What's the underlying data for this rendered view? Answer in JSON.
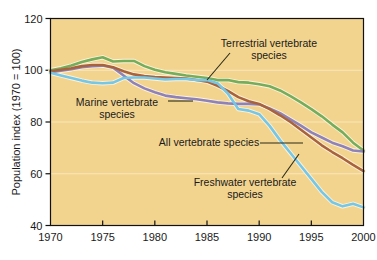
{
  "chart_data": {
    "type": "line",
    "title": "",
    "subtitle": "",
    "xlabel": "",
    "ylabel": "Population index (1970 = 100)",
    "xlim": [
      1970,
      2000
    ],
    "ylim": [
      40,
      120
    ],
    "xticks": [
      1970,
      1975,
      1980,
      1985,
      1990,
      1995,
      2000
    ],
    "yticks": [
      40,
      60,
      80,
      100,
      120
    ],
    "grid": "horizontal-light",
    "legend_position": "inline-annotations",
    "background_color": "#f2d48f",
    "x": [
      1970,
      1971,
      1972,
      1973,
      1974,
      1975,
      1976,
      1977,
      1978,
      1979,
      1980,
      1981,
      1982,
      1983,
      1984,
      1985,
      1986,
      1987,
      1988,
      1989,
      1990,
      1991,
      1992,
      1993,
      1994,
      1995,
      1996,
      1997,
      1998,
      1999,
      2000
    ],
    "series": [
      {
        "name": "Terrestrial vertebrate species",
        "color": "#76ad5a",
        "values": [
          100.0,
          100.8,
          101.8,
          103.2,
          104.2,
          105.0,
          103.4,
          103.6,
          103.6,
          101.6,
          100.2,
          99.2,
          98.6,
          98.0,
          97.5,
          97.0,
          96.2,
          96.2,
          95.4,
          95.2,
          94.6,
          93.8,
          92.2,
          90.0,
          87.6,
          85.0,
          82.2,
          79.0,
          76.0,
          72.0,
          69.0
        ]
      },
      {
        "name": "Marine vertebrate species",
        "color": "#8e82b8",
        "values": [
          99.2,
          99.8,
          100.4,
          101.2,
          101.6,
          101.8,
          101.0,
          98.0,
          95.0,
          93.0,
          91.5,
          90.2,
          89.6,
          89.2,
          88.8,
          88.2,
          87.6,
          87.2,
          87.0,
          87.0,
          86.8,
          85.2,
          83.4,
          81.0,
          78.6,
          76.0,
          74.0,
          72.0,
          70.6,
          69.0,
          68.6
        ]
      },
      {
        "name": "All vertebrate species",
        "color": "#a9633c",
        "values": [
          99.6,
          100.2,
          100.8,
          101.6,
          102.0,
          102.0,
          101.2,
          99.6,
          98.4,
          97.8,
          97.4,
          97.2,
          97.0,
          96.8,
          96.2,
          95.6,
          94.0,
          92.0,
          89.6,
          88.0,
          87.0,
          85.0,
          82.6,
          80.0,
          77.0,
          74.0,
          71.0,
          68.4,
          66.0,
          63.4,
          61.0
        ]
      },
      {
        "name": "Freshwater vertebrate species",
        "color": "#76c6e6",
        "values": [
          99.0,
          98.0,
          97.0,
          96.0,
          95.2,
          95.0,
          95.2,
          97.0,
          97.2,
          97.2,
          96.8,
          96.4,
          96.6,
          96.6,
          96.2,
          96.2,
          95.0,
          91.0,
          85.0,
          84.4,
          83.0,
          78.5,
          73.0,
          68.0,
          63.0,
          58.0,
          53.0,
          49.0,
          47.4,
          48.4,
          47.0
        ]
      }
    ],
    "annotations": [
      {
        "id": "terrestrial",
        "lines": [
          "Terrestrial vertebrate",
          "species"
        ],
        "text_anchor_x": 269,
        "text_anchor_y": 47,
        "leader_from_x": 230,
        "leader_from_y": 53,
        "leader_to_x": 207,
        "leader_to_y": 80
      },
      {
        "id": "marine",
        "lines": [
          "Marine vertebrate",
          "species"
        ],
        "text_anchor_x": 117,
        "text_anchor_y": 106,
        "leader_from_x": 168,
        "leader_from_y": 101,
        "leader_to_x": 193,
        "leader_to_y": 101
      },
      {
        "id": "all-vertebrate",
        "lines": [
          "All vertebrate species"
        ],
        "text_anchor_x": 209,
        "text_anchor_y": 146,
        "leader_from_x": 260,
        "leader_from_y": 143,
        "leader_to_x": 303,
        "leader_to_y": 143
      },
      {
        "id": "freshwater",
        "lines": [
          "Freshwater vertebrate",
          "species"
        ],
        "text_anchor_x": 245,
        "text_anchor_y": 186,
        "leader_from_x": 282,
        "leader_from_y": 178,
        "leader_to_x": 299,
        "leader_to_y": 154
      }
    ]
  }
}
